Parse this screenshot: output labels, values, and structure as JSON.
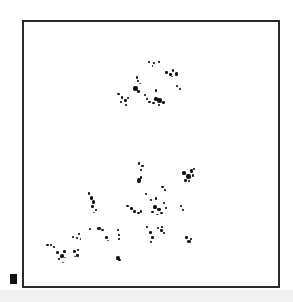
{
  "image": {
    "description": "Micrograph-style frame with clustered black specks",
    "background": "#ffffff",
    "frame_color": "#2a2a2a",
    "speck_color": "#141414",
    "band_color": "#f1f1f1",
    "marker_color": "#111111"
  },
  "frame": {
    "x": 22,
    "y": 20,
    "width": 256,
    "height": 266
  },
  "scale_marker": {
    "x": 10,
    "y": 274,
    "width": 7,
    "height": 10
  },
  "specks": [
    {
      "x": 148,
      "y": 61,
      "w": 2,
      "h": 2
    },
    {
      "x": 153,
      "y": 62,
      "w": 2,
      "h": 2
    },
    {
      "x": 158,
      "y": 61,
      "w": 2,
      "h": 2
    },
    {
      "x": 152,
      "y": 65,
      "w": 1,
      "h": 2
    },
    {
      "x": 165,
      "y": 71,
      "w": 3,
      "h": 3
    },
    {
      "x": 169,
      "y": 73,
      "w": 3,
      "h": 3
    },
    {
      "x": 172,
      "y": 69,
      "w": 2,
      "h": 3
    },
    {
      "x": 175,
      "y": 72,
      "w": 3,
      "h": 4
    },
    {
      "x": 171,
      "y": 76,
      "w": 2,
      "h": 1
    },
    {
      "x": 176,
      "y": 85,
      "w": 2,
      "h": 2
    },
    {
      "x": 179,
      "y": 88,
      "w": 2,
      "h": 2
    },
    {
      "x": 136,
      "y": 76,
      "w": 2,
      "h": 3
    },
    {
      "x": 137,
      "y": 80,
      "w": 2,
      "h": 2
    },
    {
      "x": 133,
      "y": 86,
      "w": 5,
      "h": 5
    },
    {
      "x": 137,
      "y": 90,
      "w": 3,
      "h": 3
    },
    {
      "x": 139,
      "y": 83,
      "w": 2,
      "h": 1
    },
    {
      "x": 117,
      "y": 93,
      "w": 3,
      "h": 2
    },
    {
      "x": 121,
      "y": 96,
      "w": 2,
      "h": 3
    },
    {
      "x": 124,
      "y": 99,
      "w": 3,
      "h": 3
    },
    {
      "x": 120,
      "y": 101,
      "w": 2,
      "h": 2
    },
    {
      "x": 125,
      "y": 104,
      "w": 2,
      "h": 2
    },
    {
      "x": 127,
      "y": 97,
      "w": 2,
      "h": 2
    },
    {
      "x": 144,
      "y": 94,
      "w": 2,
      "h": 2
    },
    {
      "x": 146,
      "y": 98,
      "w": 2,
      "h": 2
    },
    {
      "x": 148,
      "y": 101,
      "w": 3,
      "h": 2
    },
    {
      "x": 155,
      "y": 89,
      "w": 2,
      "h": 3
    },
    {
      "x": 154,
      "y": 97,
      "w": 4,
      "h": 4
    },
    {
      "x": 157,
      "y": 98,
      "w": 5,
      "h": 5
    },
    {
      "x": 152,
      "y": 102,
      "w": 3,
      "h": 2
    },
    {
      "x": 162,
      "y": 101,
      "w": 3,
      "h": 3
    },
    {
      "x": 158,
      "y": 104,
      "w": 2,
      "h": 2
    },
    {
      "x": 138,
      "y": 162,
      "w": 2,
      "h": 3
    },
    {
      "x": 141,
      "y": 165,
      "w": 3,
      "h": 2
    },
    {
      "x": 140,
      "y": 169,
      "w": 2,
      "h": 2
    },
    {
      "x": 137,
      "y": 178,
      "w": 4,
      "h": 5
    },
    {
      "x": 140,
      "y": 176,
      "w": 2,
      "h": 3
    },
    {
      "x": 182,
      "y": 171,
      "w": 4,
      "h": 4
    },
    {
      "x": 186,
      "y": 174,
      "w": 5,
      "h": 5
    },
    {
      "x": 190,
      "y": 169,
      "w": 3,
      "h": 4
    },
    {
      "x": 184,
      "y": 179,
      "w": 3,
      "h": 3
    },
    {
      "x": 192,
      "y": 174,
      "w": 2,
      "h": 3
    },
    {
      "x": 188,
      "y": 180,
      "w": 2,
      "h": 2
    },
    {
      "x": 193,
      "y": 168,
      "w": 2,
      "h": 2
    },
    {
      "x": 161,
      "y": 186,
      "w": 3,
      "h": 2
    },
    {
      "x": 164,
      "y": 189,
      "w": 2,
      "h": 2
    },
    {
      "x": 88,
      "y": 192,
      "w": 2,
      "h": 3
    },
    {
      "x": 90,
      "y": 196,
      "w": 3,
      "h": 4
    },
    {
      "x": 92,
      "y": 200,
      "w": 3,
      "h": 4
    },
    {
      "x": 91,
      "y": 205,
      "w": 3,
      "h": 3
    },
    {
      "x": 95,
      "y": 209,
      "w": 2,
      "h": 2
    },
    {
      "x": 93,
      "y": 212,
      "w": 2,
      "h": 1
    },
    {
      "x": 126,
      "y": 205,
      "w": 3,
      "h": 2
    },
    {
      "x": 130,
      "y": 207,
      "w": 3,
      "h": 3
    },
    {
      "x": 133,
      "y": 210,
      "w": 3,
      "h": 3
    },
    {
      "x": 137,
      "y": 212,
      "w": 3,
      "h": 2
    },
    {
      "x": 140,
      "y": 210,
      "w": 2,
      "h": 3
    },
    {
      "x": 145,
      "y": 193,
      "w": 2,
      "h": 2
    },
    {
      "x": 150,
      "y": 199,
      "w": 2,
      "h": 2
    },
    {
      "x": 155,
      "y": 197,
      "w": 2,
      "h": 3
    },
    {
      "x": 153,
      "y": 205,
      "w": 4,
      "h": 4
    },
    {
      "x": 157,
      "y": 208,
      "w": 4,
      "h": 3
    },
    {
      "x": 151,
      "y": 211,
      "w": 3,
      "h": 2
    },
    {
      "x": 160,
      "y": 212,
      "w": 3,
      "h": 2
    },
    {
      "x": 165,
      "y": 207,
      "w": 2,
      "h": 2
    },
    {
      "x": 163,
      "y": 202,
      "w": 2,
      "h": 2
    },
    {
      "x": 156,
      "y": 214,
      "w": 3,
      "h": 1
    },
    {
      "x": 180,
      "y": 205,
      "w": 2,
      "h": 2
    },
    {
      "x": 182,
      "y": 209,
      "w": 2,
      "h": 2
    },
    {
      "x": 89,
      "y": 228,
      "w": 2,
      "h": 2
    },
    {
      "x": 97,
      "y": 227,
      "w": 4,
      "h": 3
    },
    {
      "x": 101,
      "y": 229,
      "w": 3,
      "h": 2
    },
    {
      "x": 72,
      "y": 236,
      "w": 2,
      "h": 2
    },
    {
      "x": 76,
      "y": 237,
      "w": 2,
      "h": 2
    },
    {
      "x": 78,
      "y": 233,
      "w": 2,
      "h": 2
    },
    {
      "x": 80,
      "y": 238,
      "w": 1,
      "h": 2
    },
    {
      "x": 105,
      "y": 236,
      "w": 3,
      "h": 3
    },
    {
      "x": 107,
      "y": 240,
      "w": 2,
      "h": 1
    },
    {
      "x": 117,
      "y": 229,
      "w": 2,
      "h": 2
    },
    {
      "x": 118,
      "y": 234,
      "w": 2,
      "h": 2
    },
    {
      "x": 118,
      "y": 238,
      "w": 2,
      "h": 2
    },
    {
      "x": 146,
      "y": 226,
      "w": 2,
      "h": 2
    },
    {
      "x": 149,
      "y": 231,
      "w": 3,
      "h": 3
    },
    {
      "x": 151,
      "y": 236,
      "w": 3,
      "h": 3
    },
    {
      "x": 150,
      "y": 241,
      "w": 2,
      "h": 2
    },
    {
      "x": 157,
      "y": 227,
      "w": 2,
      "h": 2
    },
    {
      "x": 160,
      "y": 229,
      "w": 3,
      "h": 3
    },
    {
      "x": 163,
      "y": 232,
      "w": 2,
      "h": 2
    },
    {
      "x": 161,
      "y": 226,
      "w": 2,
      "h": 2
    },
    {
      "x": 185,
      "y": 236,
      "w": 3,
      "h": 3
    },
    {
      "x": 187,
      "y": 240,
      "w": 4,
      "h": 3
    },
    {
      "x": 190,
      "y": 238,
      "w": 2,
      "h": 2
    },
    {
      "x": 46,
      "y": 244,
      "w": 3,
      "h": 2
    },
    {
      "x": 50,
      "y": 244,
      "w": 2,
      "h": 2
    },
    {
      "x": 53,
      "y": 246,
      "w": 2,
      "h": 2
    },
    {
      "x": 56,
      "y": 251,
      "w": 3,
      "h": 3
    },
    {
      "x": 60,
      "y": 254,
      "w": 4,
      "h": 4
    },
    {
      "x": 63,
      "y": 250,
      "w": 3,
      "h": 3
    },
    {
      "x": 58,
      "y": 258,
      "w": 2,
      "h": 2
    },
    {
      "x": 64,
      "y": 257,
      "w": 2,
      "h": 1
    },
    {
      "x": 62,
      "y": 262,
      "w": 2,
      "h": 1
    },
    {
      "x": 73,
      "y": 250,
      "w": 3,
      "h": 3
    },
    {
      "x": 76,
      "y": 254,
      "w": 3,
      "h": 3
    },
    {
      "x": 77,
      "y": 249,
      "w": 2,
      "h": 2
    },
    {
      "x": 74,
      "y": 256,
      "w": 2,
      "h": 1
    },
    {
      "x": 116,
      "y": 256,
      "w": 4,
      "h": 4
    },
    {
      "x": 118,
      "y": 259,
      "w": 3,
      "h": 2
    }
  ],
  "chart_data": {
    "type": "scatter",
    "title": "",
    "xlabel": "",
    "ylabel": "",
    "note": "Particle/speck positions in image pixel coordinates (origin top-left)",
    "clusters": [
      {
        "name": "upper-cluster",
        "center": [
          150,
          88
        ],
        "approx_extent": [
          [
            117,
            61
          ],
          [
            180,
            105
          ]
        ]
      },
      {
        "name": "lower-cluster",
        "center": [
          120,
          215
        ],
        "approx_extent": [
          [
            45,
            162
          ],
          [
            195,
            262
          ]
        ]
      }
    ],
    "xlim": [
      22,
      278
    ],
    "ylim": [
      20,
      286
    ],
    "grid": false
  }
}
